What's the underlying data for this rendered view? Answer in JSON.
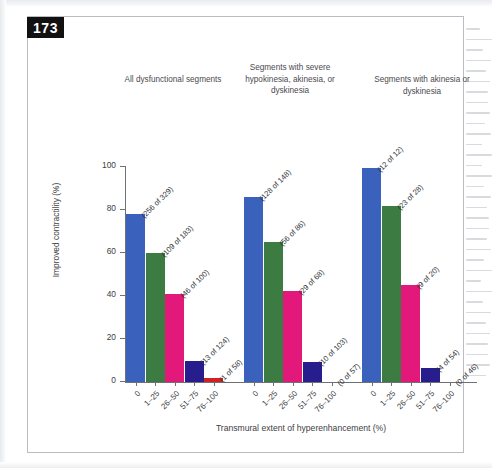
{
  "figure": {
    "number": "173",
    "badge_bg": "#111112"
  },
  "chart_data": {
    "type": "bar",
    "title": "",
    "xlabel": "Transmural extent of hyperenhancement (%)",
    "ylabel": "Improved contractility (%)",
    "ylim": [
      0,
      100
    ],
    "yticks": [
      0,
      20,
      40,
      60,
      80,
      100
    ],
    "ytick_labels": [
      "0",
      "20",
      "40",
      "60",
      "80",
      "100"
    ],
    "categories": [
      "0",
      "1–25",
      "26–50",
      "51–75",
      "76–100"
    ],
    "grid": false,
    "legend": "none",
    "colors": [
      "#3a62bc",
      "#3c7b42",
      "#e2187b",
      "#281d8d",
      "#cf2222"
    ],
    "panels": [
      {
        "title": "All dysfunctional segments",
        "values": [
          78,
          60,
          41,
          10,
          2
        ],
        "annotations": [
          "(256 of 329)",
          "(109 of 183)",
          "(46 of 100)",
          "(13 of 124)",
          "(1 of 58)"
        ]
      },
      {
        "title": "Segments with severe hypokinesia, akinesia, or dyskinesia",
        "values": [
          86,
          65,
          42.5,
          9.5,
          0
        ],
        "annotations": [
          "(128 of 148)",
          "(56 of 86)",
          "(29 of 68)",
          "(10 of 103)",
          "(0 of 57)"
        ]
      },
      {
        "title": "Segments with akinesia or dyskinesia",
        "values": [
          99.5,
          82,
          45,
          6.5,
          0
        ],
        "annotations": [
          "(12 of 12)",
          "(23 of 28)",
          "(9 of 20)",
          "(4 of 54)",
          "(0 of 46)"
        ]
      }
    ]
  }
}
